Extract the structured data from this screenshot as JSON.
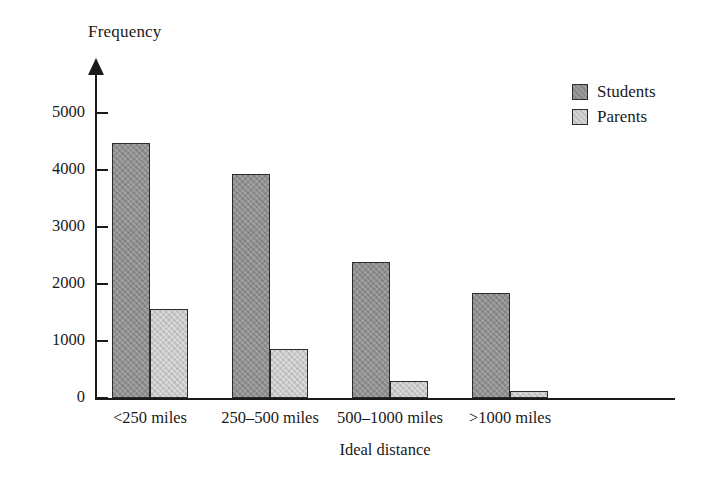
{
  "chart_data": {
    "type": "bar",
    "title": "",
    "ylabel": "Frequency",
    "xlabel": "Ideal distance",
    "categories": [
      "<250 miles",
      "250–500 miles",
      "500–1000 miles",
      ">1000 miles"
    ],
    "series": [
      {
        "name": "Students",
        "values": [
          4480,
          3930,
          2380,
          1850
        ],
        "color": "#8f8f8f"
      },
      {
        "name": "Parents",
        "values": [
          1570,
          860,
          290,
          130
        ],
        "color": "#c8c8c8"
      }
    ],
    "ylim": [
      0,
      5600
    ],
    "yticks": [
      0,
      1000,
      2000,
      3000,
      4000,
      5000
    ],
    "ytick_labels": [
      "0",
      "1000",
      "2000",
      "3000",
      "4000",
      "5000"
    ],
    "grid": false,
    "legend_position": "top-right",
    "axis_color": "#1a1a1a",
    "background": "#ffffff"
  },
  "legend": {
    "entries": [
      {
        "label": "Students",
        "swatch": "students-swatch"
      },
      {
        "label": "Parents",
        "swatch": "parents-swatch"
      }
    ]
  },
  "axes": {
    "y_title": "Frequency",
    "x_title": "Ideal distance"
  }
}
